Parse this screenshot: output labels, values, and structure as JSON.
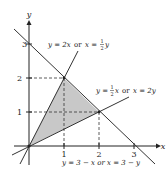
{
  "diagram": {
    "axes": {
      "x_label": "x",
      "y_label": "y",
      "x_ticks": [
        "1",
        "2",
        "3"
      ],
      "y_ticks": [
        "1",
        "2",
        "3"
      ]
    },
    "lines": [
      {
        "id": "line-2x",
        "label_main": "y = 2x",
        "label_or": "or",
        "label_alt": "x = ",
        "label_frac_num": "1",
        "label_frac_den": "2",
        "label_tail": "y"
      },
      {
        "id": "line-half-x",
        "label_main": "y = ",
        "label_frac_num": "1",
        "label_frac_den": "2",
        "label_after_frac": "x",
        "label_or": "or",
        "label_alt": "x = 2y"
      },
      {
        "id": "line-3-minus-x",
        "label": "y = 3 − x  or  x = 3 − y"
      }
    ],
    "region": {
      "vertices": [
        [
          0,
          0
        ],
        [
          1,
          2
        ],
        [
          2,
          1
        ]
      ],
      "fill": "#c8c8c8"
    },
    "points": [
      {
        "x": 1,
        "y": 2
      },
      {
        "x": 2,
        "y": 1
      }
    ]
  }
}
